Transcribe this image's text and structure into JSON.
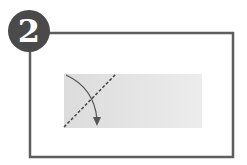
{
  "step": {
    "number": "2"
  },
  "colors": {
    "frame": "#5e5e5e",
    "badge": "#4a4a4a",
    "paper": "#e6e6e6",
    "fold_line": "#444444",
    "arrow": "#555555"
  },
  "diagram": {
    "elements": [
      "step-badge",
      "frame",
      "paper-rectangle",
      "dashed-fold-line",
      "curved-fold-arrow"
    ]
  }
}
